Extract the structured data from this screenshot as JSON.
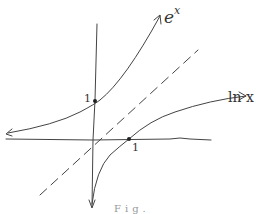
{
  "diagram": {
    "title": "",
    "axes": {
      "x_axis": true,
      "y_axis": true
    },
    "curves": [
      {
        "name": "exp",
        "label": "e^x",
        "label_base": "e",
        "label_sup": "x",
        "marked_point_label": "1"
      },
      {
        "name": "ln",
        "label": "ln x",
        "marked_point_label": "1"
      }
    ],
    "symmetry_line": {
      "label": "",
      "style": "dashed"
    },
    "bottom_caption": "Fig."
  }
}
